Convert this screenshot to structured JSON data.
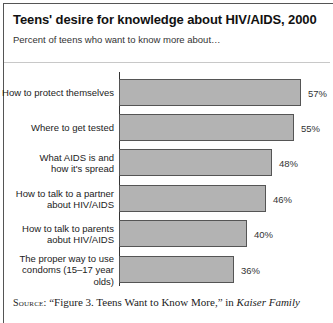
{
  "chart_data": {
    "type": "bar",
    "orientation": "horizontal",
    "title": "Teens' desire for knowledge about HIV/AIDS, 2000",
    "subtitle": "Percent of teens who want to know more about…",
    "categories": [
      "How to protect themselves",
      "Where to get tested",
      "What AIDS is and\nhow it's spread",
      "How to talk to a partner\nabout HIV/AIDS",
      "How to talk to parents\naobut HIV/AIDS",
      "The proper way to use\ncondoms (15–17 year olds)"
    ],
    "values": [
      57,
      55,
      48,
      46,
      40,
      36
    ],
    "value_labels": [
      "57%",
      "55%",
      "48%",
      "46%",
      "40%",
      "36%"
    ],
    "xlabel": "",
    "ylabel": "",
    "unit": "%",
    "grid": false,
    "legend": null,
    "bar_color": "#b3b3b3",
    "bar_border_color": "#555555"
  },
  "source": {
    "prefix": "Source:",
    "text": " “Figure 3. Teens Want to Know More,” in ",
    "italic": "Kaiser Family"
  },
  "layout": {
    "axis_x": 119,
    "px_per_unit": 3.19,
    "row_tops": [
      79,
      114,
      149,
      185,
      220,
      256
    ]
  }
}
